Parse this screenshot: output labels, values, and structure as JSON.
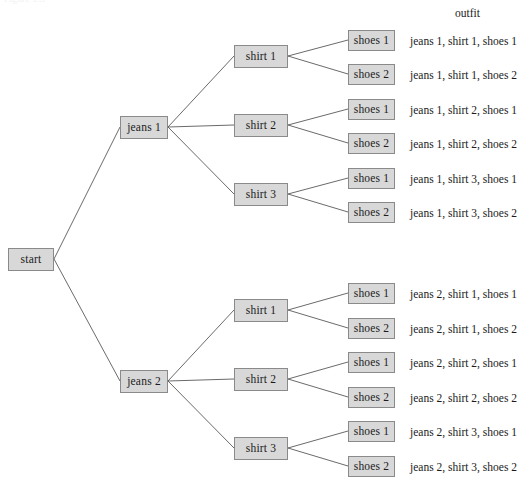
{
  "figure": {
    "type": "probability-tree-diagram",
    "caption_sliver": "Figure 1.3",
    "column_header": "outfit",
    "edge_color": "#595959",
    "node_fill": "#d8d8d8",
    "node_border": "#8a8a8a",
    "text_color": "#1b1b1b",
    "background": "#ffffff"
  },
  "nodes": {
    "root": {
      "label": "start",
      "x": 8,
      "y": 248,
      "w": 46,
      "h": 23
    },
    "level1": [
      {
        "label": "jeans 1",
        "x": 120,
        "y": 116,
        "w": 48,
        "h": 23
      },
      {
        "label": "jeans 2",
        "x": 120,
        "y": 370,
        "w": 48,
        "h": 23
      }
    ],
    "level2": [
      {
        "label": "shirt 1",
        "x": 234,
        "y": 45,
        "w": 54,
        "h": 23
      },
      {
        "label": "shirt 2",
        "x": 234,
        "y": 114,
        "w": 54,
        "h": 23
      },
      {
        "label": "shirt 3",
        "x": 234,
        "y": 183,
        "w": 54,
        "h": 23
      },
      {
        "label": "shirt 1",
        "x": 234,
        "y": 299,
        "w": 54,
        "h": 23
      },
      {
        "label": "shirt 2",
        "x": 234,
        "y": 368,
        "w": 54,
        "h": 23
      },
      {
        "label": "shirt 3",
        "x": 234,
        "y": 437,
        "w": 54,
        "h": 23
      }
    ],
    "level3": [
      {
        "label": "shoes 1",
        "x": 348,
        "y": 30,
        "w": 47,
        "h": 21
      },
      {
        "label": "shoes 2",
        "x": 348,
        "y": 64,
        "w": 47,
        "h": 21
      },
      {
        "label": "shoes 1",
        "x": 348,
        "y": 99,
        "w": 47,
        "h": 21
      },
      {
        "label": "shoes 2",
        "x": 348,
        "y": 133,
        "w": 47,
        "h": 21
      },
      {
        "label": "shoes 1",
        "x": 348,
        "y": 168,
        "w": 47,
        "h": 21
      },
      {
        "label": "shoes 2",
        "x": 348,
        "y": 202,
        "w": 47,
        "h": 21
      },
      {
        "label": "shoes 1",
        "x": 348,
        "y": 283,
        "w": 47,
        "h": 21
      },
      {
        "label": "shoes 2",
        "x": 348,
        "y": 318,
        "w": 47,
        "h": 21
      },
      {
        "label": "shoes 1",
        "x": 348,
        "y": 352,
        "w": 47,
        "h": 21
      },
      {
        "label": "shoes 2",
        "x": 348,
        "y": 387,
        "w": 47,
        "h": 21
      },
      {
        "label": "shoes 1",
        "x": 348,
        "y": 421,
        "w": 47,
        "h": 21
      },
      {
        "label": "shoes 2",
        "x": 348,
        "y": 456,
        "w": 47,
        "h": 21
      }
    ]
  },
  "outfits": [
    {
      "text": "jeans 1, shirt 1, shoes 1",
      "x": 410,
      "y": 36
    },
    {
      "text": "jeans 1, shirt 1, shoes 2",
      "x": 410,
      "y": 70
    },
    {
      "text": "jeans 1, shirt 2, shoes 1",
      "x": 410,
      "y": 105
    },
    {
      "text": "jeans 1, shirt 2, shoes 2",
      "x": 410,
      "y": 139
    },
    {
      "text": "jeans 1, shirt 3, shoes 1",
      "x": 410,
      "y": 174
    },
    {
      "text": "jeans 1, shirt 3, shoes 2",
      "x": 410,
      "y": 208
    },
    {
      "text": "jeans 2, shirt 1, shoes 1",
      "x": 410,
      "y": 289
    },
    {
      "text": "jeans 2, shirt 1, shoes 2",
      "x": 410,
      "y": 324
    },
    {
      "text": "jeans 2, shirt 2, shoes 1",
      "x": 410,
      "y": 358
    },
    {
      "text": "jeans 2, shirt 2, shoes 2",
      "x": 410,
      "y": 393
    },
    {
      "text": "jeans 2, shirt 3, shoes 1",
      "x": 410,
      "y": 427
    },
    {
      "text": "jeans 2, shirt 3, shoes 2",
      "x": 410,
      "y": 462
    }
  ],
  "header": {
    "label": "outfit",
    "x": 455,
    "y": 8
  },
  "edges": [
    {
      "from": "start",
      "to": "jeans 1",
      "x1": 54,
      "y1": 259,
      "x2": 120,
      "y2": 127
    },
    {
      "from": "start",
      "to": "jeans 2",
      "x1": 54,
      "y1": 259,
      "x2": 120,
      "y2": 381
    },
    {
      "from": "jeans 1",
      "to": "shirt 1",
      "x1": 168,
      "y1": 127,
      "x2": 234,
      "y2": 56
    },
    {
      "from": "jeans 1",
      "to": "shirt 2",
      "x1": 168,
      "y1": 127,
      "x2": 234,
      "y2": 125
    },
    {
      "from": "jeans 1",
      "to": "shirt 3",
      "x1": 168,
      "y1": 127,
      "x2": 234,
      "y2": 194
    },
    {
      "from": "jeans 2",
      "to": "shirt 1",
      "x1": 168,
      "y1": 381,
      "x2": 234,
      "y2": 310
    },
    {
      "from": "jeans 2",
      "to": "shirt 2",
      "x1": 168,
      "y1": 381,
      "x2": 234,
      "y2": 379
    },
    {
      "from": "jeans 2",
      "to": "shirt 3",
      "x1": 168,
      "y1": 381,
      "x2": 234,
      "y2": 448
    },
    {
      "from": "shirt 1a",
      "to": "shoes 1",
      "x1": 288,
      "y1": 56,
      "x2": 348,
      "y2": 40
    },
    {
      "from": "shirt 1a",
      "to": "shoes 2",
      "x1": 288,
      "y1": 56,
      "x2": 348,
      "y2": 74
    },
    {
      "from": "shirt 2a",
      "to": "shoes 1",
      "x1": 288,
      "y1": 125,
      "x2": 348,
      "y2": 109
    },
    {
      "from": "shirt 2a",
      "to": "shoes 2",
      "x1": 288,
      "y1": 125,
      "x2": 348,
      "y2": 143
    },
    {
      "from": "shirt 3a",
      "to": "shoes 1",
      "x1": 288,
      "y1": 194,
      "x2": 348,
      "y2": 178
    },
    {
      "from": "shirt 3a",
      "to": "shoes 2",
      "x1": 288,
      "y1": 194,
      "x2": 348,
      "y2": 212
    },
    {
      "from": "shirt 1b",
      "to": "shoes 1",
      "x1": 288,
      "y1": 310,
      "x2": 348,
      "y2": 293
    },
    {
      "from": "shirt 1b",
      "to": "shoes 2",
      "x1": 288,
      "y1": 310,
      "x2": 348,
      "y2": 328
    },
    {
      "from": "shirt 2b",
      "to": "shoes 1",
      "x1": 288,
      "y1": 379,
      "x2": 348,
      "y2": 362
    },
    {
      "from": "shirt 2b",
      "to": "shoes 2",
      "x1": 288,
      "y1": 379,
      "x2": 348,
      "y2": 397
    },
    {
      "from": "shirt 3b",
      "to": "shoes 1",
      "x1": 288,
      "y1": 448,
      "x2": 348,
      "y2": 431
    },
    {
      "from": "shirt 3b",
      "to": "shoes 2",
      "x1": 288,
      "y1": 448,
      "x2": 348,
      "y2": 466
    }
  ]
}
